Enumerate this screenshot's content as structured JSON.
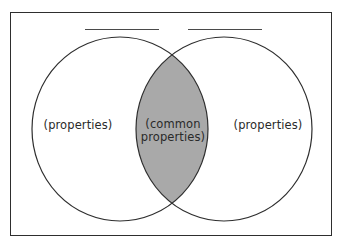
{
  "diagram": {
    "type": "venn",
    "title_blanks": [
      {
        "label": ""
      },
      {
        "label": ""
      }
    ],
    "left_set": {
      "label": "(properties)"
    },
    "right_set": {
      "label": "(properties)"
    },
    "intersection": {
      "label_line1": "(common",
      "label_line2": "properties)",
      "fill_color": "#a9a9a9"
    },
    "colors": {
      "stroke": "#2e2e2e",
      "background": "#ffffff",
      "text": "#2a2a2a"
    }
  }
}
